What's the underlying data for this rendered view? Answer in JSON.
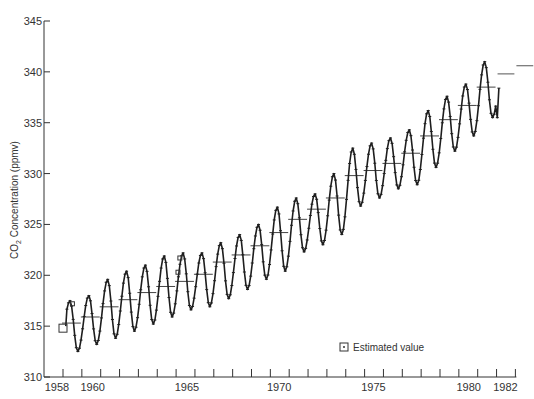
{
  "chart_data": {
    "type": "line",
    "title": "",
    "xlabel": "",
    "ylabel": "CO2 Concentration (ppmv)",
    "ylabel_parts": {
      "pre": "CO",
      "sub": "2",
      "post": " Concentration (ppmv)"
    },
    "ylim": [
      310,
      345
    ],
    "xlim": [
      1957.5,
      1982.5
    ],
    "yticks": [
      310,
      315,
      320,
      325,
      330,
      335,
      340,
      345
    ],
    "xtick_labels": [
      "1958",
      "1960",
      "1965",
      "1970",
      "1975",
      "1980",
      "1982"
    ],
    "grid": false,
    "legend": {
      "position": "lower right",
      "entries": [
        {
          "symbol": "boxed-dot",
          "label": "Estimated value"
        }
      ]
    },
    "series": [
      {
        "name": "Monthly mean CO2 (Mauna Loa)",
        "seasonal_amplitude_ppmv": 6,
        "annual": [
          {
            "year": 1958,
            "mean": 315.3,
            "max": 317.5,
            "min": 312.5
          },
          {
            "year": 1959,
            "mean": 315.9,
            "max": 318.0,
            "min": 313.2
          },
          {
            "year": 1960,
            "mean": 316.9,
            "max": 319.6,
            "min": 313.8
          },
          {
            "year": 1961,
            "mean": 317.6,
            "max": 320.4,
            "min": 314.5
          },
          {
            "year": 1962,
            "mean": 318.3,
            "max": 321.0,
            "min": 315.2
          },
          {
            "year": 1963,
            "mean": 318.9,
            "max": 321.9,
            "min": 315.9
          },
          {
            "year": 1964,
            "mean": 319.4,
            "max": 322.2,
            "min": 316.6
          },
          {
            "year": 1965,
            "mean": 320.1,
            "max": 322.2,
            "min": 316.9
          },
          {
            "year": 1966,
            "mean": 321.3,
            "max": 323.2,
            "min": 317.7
          },
          {
            "year": 1967,
            "mean": 322.0,
            "max": 324.0,
            "min": 318.6
          },
          {
            "year": 1968,
            "mean": 322.9,
            "max": 325.0,
            "min": 319.6
          },
          {
            "year": 1969,
            "mean": 324.2,
            "max": 326.7,
            "min": 320.4
          },
          {
            "year": 1970,
            "mean": 325.5,
            "max": 327.6,
            "min": 322.3
          },
          {
            "year": 1971,
            "mean": 326.5,
            "max": 328.0,
            "min": 323.0
          },
          {
            "year": 1972,
            "mean": 327.6,
            "max": 330.0,
            "min": 324.0
          },
          {
            "year": 1973,
            "mean": 329.8,
            "max": 332.5,
            "min": 326.8
          },
          {
            "year": 1974,
            "mean": 330.3,
            "max": 333.0,
            "min": 327.6
          },
          {
            "year": 1975,
            "mean": 331.0,
            "max": 333.5,
            "min": 328.5
          },
          {
            "year": 1976,
            "mean": 332.0,
            "max": 334.3,
            "min": 328.9
          },
          {
            "year": 1977,
            "mean": 333.7,
            "max": 336.2,
            "min": 330.6
          },
          {
            "year": 1978,
            "mean": 335.3,
            "max": 337.6,
            "min": 332.2
          },
          {
            "year": 1979,
            "mean": 336.7,
            "max": 338.8,
            "min": 333.7
          },
          {
            "year": 1980,
            "mean": 338.5,
            "max": 341.0,
            "min": 335.5
          }
        ],
        "partial_1981": {
          "start": 335.5,
          "end": 338.4
        }
      },
      {
        "name": "Annual mean (no monthly data)",
        "annual": [
          {
            "year": 1981,
            "mean": 339.8
          },
          {
            "year": 1982,
            "mean": 340.6
          }
        ]
      }
    ],
    "annotations": [
      {
        "type": "estimated-value-markers",
        "years": [
          1958,
          1964
        ],
        "label": "Estimated value"
      }
    ]
  },
  "legend": {
    "label": "Estimated value"
  }
}
